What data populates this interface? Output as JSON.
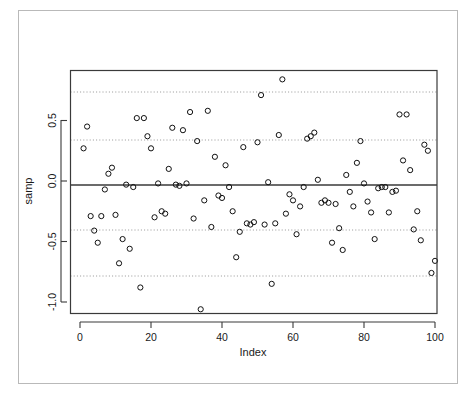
{
  "figure": {
    "ylabel": "samp",
    "xlabel": "Index"
  },
  "chart_data": {
    "type": "scatter",
    "title": "",
    "xlabel": "Index",
    "ylabel": "samp",
    "xlim": [
      -3,
      103
    ],
    "ylim": [
      -1.18,
      0.92
    ],
    "xticks": [
      0,
      20,
      40,
      60,
      80,
      100
    ],
    "yticks": [
      0.5,
      0.0,
      -0.5,
      -1.0
    ],
    "ytick_labels": [
      "0.5",
      "0.0",
      "-0.5",
      "-1.0"
    ],
    "xtick_labels": [
      "0",
      "20",
      "40",
      "60",
      "80",
      "100"
    ],
    "grid": false,
    "legend": null,
    "marker": "open-circle",
    "reference_lines": [
      {
        "name": "mean",
        "value": -0.04,
        "style": "solid"
      },
      {
        "name": "upper-outer",
        "value": 0.73,
        "style": "dotted"
      },
      {
        "name": "upper-inner",
        "value": 0.33,
        "style": "dotted"
      },
      {
        "name": "lower-inner",
        "value": -0.41,
        "style": "dotted"
      },
      {
        "name": "lower-outer",
        "value": -0.79,
        "style": "dotted"
      }
    ],
    "x": [
      1,
      2,
      3,
      4,
      5,
      6,
      7,
      8,
      9,
      10,
      11,
      12,
      13,
      14,
      15,
      16,
      17,
      18,
      19,
      20,
      21,
      22,
      23,
      24,
      25,
      26,
      27,
      28,
      29,
      30,
      31,
      32,
      33,
      34,
      35,
      36,
      37,
      38,
      39,
      40,
      41,
      42,
      43,
      44,
      45,
      46,
      47,
      48,
      49,
      50,
      51,
      52,
      53,
      54,
      55,
      56,
      57,
      58,
      59,
      60,
      61,
      62,
      63,
      64,
      65,
      66,
      67,
      68,
      69,
      70,
      71,
      72,
      73,
      74,
      75,
      76,
      77,
      78,
      79,
      80,
      81,
      82,
      83,
      84,
      85,
      86,
      87,
      88,
      89,
      90,
      91,
      92,
      93,
      94,
      95,
      96,
      97,
      98,
      99,
      100
    ],
    "y": [
      0.27,
      0.45,
      -0.29,
      -0.41,
      -0.51,
      -0.29,
      -0.07,
      0.06,
      0.11,
      -0.28,
      -0.68,
      -0.48,
      -0.03,
      -0.56,
      -0.05,
      0.52,
      -0.88,
      0.52,
      0.37,
      0.27,
      -0.3,
      -0.02,
      -0.25,
      -0.27,
      0.1,
      0.44,
      -0.03,
      -0.04,
      0.42,
      -0.02,
      0.57,
      -0.31,
      0.33,
      -1.06,
      -0.16,
      0.58,
      -0.38,
      0.2,
      -0.12,
      -0.14,
      0.13,
      -0.05,
      -0.25,
      -0.63,
      -0.42,
      0.28,
      -0.35,
      -0.36,
      -0.34,
      0.32,
      0.71,
      -0.36,
      -0.01,
      -0.85,
      -0.35,
      0.38,
      0.84,
      -0.27,
      -0.11,
      -0.16,
      -0.44,
      -0.21,
      -0.05,
      0.35,
      0.37,
      0.4,
      0.01,
      -0.18,
      -0.16,
      -0.18,
      -0.51,
      -0.19,
      -0.39,
      -0.57,
      0.05,
      -0.09,
      -0.21,
      0.15,
      0.33,
      -0.02,
      -0.17,
      -0.26,
      -0.48,
      -0.06,
      -0.05,
      -0.05,
      -0.26,
      -0.09,
      -0.08,
      0.55,
      0.17,
      0.55,
      0.09,
      -0.4,
      -0.25,
      -0.49,
      0.3,
      0.25,
      -0.76,
      -0.66,
      0.68
    ]
  }
}
